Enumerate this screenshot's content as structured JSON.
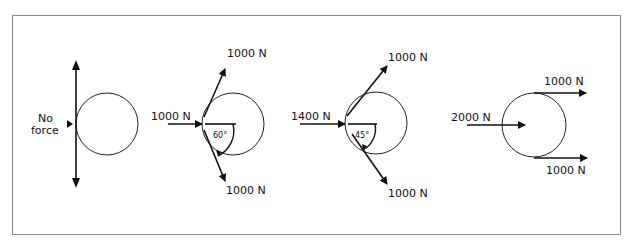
{
  "diagram": {
    "panels": [
      {
        "id": "no-force",
        "label_line1": "No",
        "label_line2": "force"
      },
      {
        "id": "panel-60",
        "input_force": "1000 N",
        "top_force": "1000 N",
        "bottom_force": "1000 N",
        "angle": "60°"
      },
      {
        "id": "panel-45",
        "input_force": "1400 N",
        "top_force": "1000 N",
        "bottom_force": "1000 N",
        "angle": "45°"
      },
      {
        "id": "panel-parallel",
        "input_force": "2000 N",
        "top_force": "1000 N",
        "bottom_force": "1000 N"
      }
    ],
    "colors": {
      "stroke": "#111111",
      "frame": "#8a8a8a"
    }
  }
}
